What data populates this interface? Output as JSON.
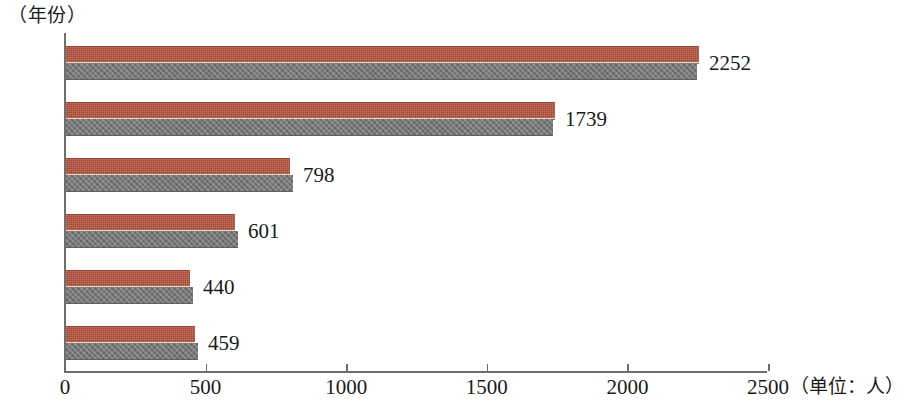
{
  "chart_data": {
    "type": "bar",
    "orientation": "horizontal",
    "title": "",
    "xlabel": "（单位：人）",
    "ylabel": "（年份）",
    "categories": [
      "2019",
      "2018",
      "2017",
      "2016",
      "2015",
      "2014"
    ],
    "values": [
      2252,
      1739,
      798,
      601,
      440,
      459
    ],
    "value_labels": [
      "2252",
      "1739",
      "798",
      "601",
      "440",
      "459"
    ],
    "xlim": [
      0,
      2500
    ],
    "xticks": [
      0,
      500,
      1000,
      1500,
      2000,
      2500
    ],
    "xtick_labels": [
      "0",
      "500",
      "1000",
      "1500",
      "2000",
      "2500"
    ],
    "grid": false,
    "legend": false,
    "series": [
      {
        "name": "人数",
        "values": [
          2252,
          1739,
          798,
          601,
          440,
          459
        ]
      }
    ],
    "bar_style": {
      "top_band_color": "#b5523c",
      "bottom_band_color": "#77777a",
      "description": "each bar drawn as a red-orange upper band over a gray lower band"
    }
  },
  "axes": {
    "y_caption": "（年份）",
    "x_caption": "（单位：人）",
    "axis_color": "#6e6e6e"
  }
}
